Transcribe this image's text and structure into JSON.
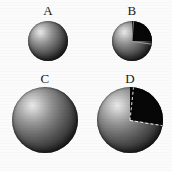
{
  "figure": {
    "background_color": "#fbfbfb",
    "layout": "2x2-grid",
    "panels": [
      {
        "id": "A",
        "label": "A",
        "shape": "sphere",
        "size": "small",
        "cutaway": false,
        "diameter_px": 40,
        "center_x_px": 48,
        "center_y_px": 41,
        "label_x_px": 48,
        "label_y_px": 6,
        "surface_color": "#6d6d6d",
        "highlight_color": "#e9e9e9",
        "shadow_color": "#141414"
      },
      {
        "id": "B",
        "label": "B",
        "shape": "sphere",
        "size": "small",
        "cutaway": true,
        "cut_fill_color": "#070707",
        "cut_start_angle_deg": -12,
        "cut_end_angle_deg": 84,
        "cut_edge_style": "solid",
        "diameter_px": 40,
        "center_x_px": 132,
        "center_y_px": 41,
        "label_x_px": 132,
        "label_y_px": 6,
        "surface_color": "#6d6d6d",
        "highlight_color": "#e9e9e9",
        "shadow_color": "#141414"
      },
      {
        "id": "C",
        "label": "C",
        "shape": "sphere",
        "size": "large",
        "cutaway": false,
        "diameter_px": 66,
        "center_x_px": 45,
        "center_y_px": 120,
        "label_x_px": 45,
        "label_y_px": 75,
        "surface_color": "#6d6d6d",
        "highlight_color": "#e9e9e9",
        "shadow_color": "#141414"
      },
      {
        "id": "D",
        "label": "D",
        "shape": "sphere",
        "size": "large",
        "cutaway": true,
        "cut_fill_color": "#070707",
        "cut_start_angle_deg": -10,
        "cut_end_angle_deg": 76,
        "cut_edge_style": "dashed",
        "cut_edge_color": "#f2f2f2",
        "diameter_px": 66,
        "center_x_px": 130,
        "center_y_px": 120,
        "label_x_px": 130,
        "label_y_px": 75,
        "surface_color": "#6d6d6d",
        "highlight_color": "#e9e9e9",
        "shadow_color": "#141414"
      }
    ]
  }
}
